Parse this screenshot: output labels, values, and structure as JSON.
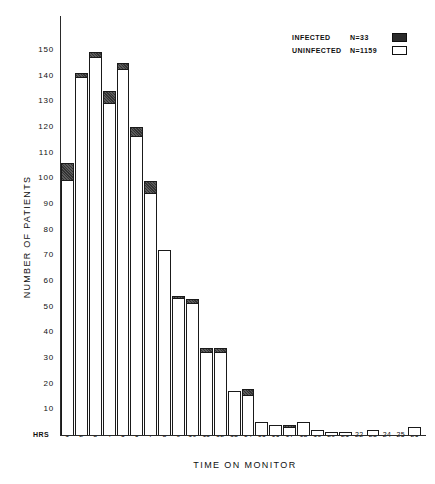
{
  "figure": {
    "y_axis_label": "NUMBER OF PATIENTS",
    "x_axis_label": "TIME ON MONITOR",
    "hrs_label": "HRS"
  },
  "legend": {
    "position": "top-right",
    "entries": [
      {
        "label": "INFECTED",
        "n": "N=33",
        "swatch": "filled-black-swatch"
      },
      {
        "label": "UNINFECTED",
        "n": "N=1159",
        "swatch": "open-white-swatch"
      }
    ]
  },
  "chart_data": {
    "type": "bar",
    "subtype": "stacked-histogram",
    "title": "",
    "xlabel": "TIME ON MONITOR",
    "ylabel": "NUMBER OF PATIENTS",
    "xlim": [
      0,
      26
    ],
    "ylim": [
      0,
      155
    ],
    "ytick_values": [
      10,
      20,
      30,
      40,
      50,
      60,
      70,
      80,
      90,
      100,
      110,
      120,
      130,
      140,
      150
    ],
    "ytick_labels": [
      "10",
      "20",
      "30",
      "40",
      "50",
      "60",
      "70",
      "80",
      "90",
      "100",
      "110",
      "120",
      "130",
      "140",
      "150"
    ],
    "grid": false,
    "categories": [
      1,
      2,
      3,
      4,
      5,
      6,
      7,
      8,
      9,
      10,
      11,
      12,
      13,
      14,
      15,
      16,
      17,
      18,
      19,
      20,
      21,
      22,
      23,
      24,
      25,
      26
    ],
    "xtick_labels": [
      "1",
      "2",
      "3",
      "4",
      "5",
      "6",
      "7",
      "8",
      "9",
      "10",
      "11",
      "12",
      "13",
      "14",
      "15",
      "16",
      "17",
      "18",
      "19",
      "20",
      "21",
      "22",
      "23",
      "24",
      "25",
      "26"
    ],
    "series": [
      {
        "name": "UNINFECTED",
        "color": "#ffffff",
        "total": 1159,
        "values": [
          99,
          139,
          147,
          129,
          142,
          116,
          94,
          72,
          53,
          51,
          32,
          32,
          17,
          15,
          5,
          4,
          3,
          5,
          2,
          1,
          1,
          0,
          2,
          0,
          0,
          3
        ]
      },
      {
        "name": "INFECTED",
        "color": "#333333",
        "total": 33,
        "values": [
          7,
          2,
          2,
          5,
          3,
          4,
          5,
          0,
          1,
          2,
          2,
          2,
          0,
          3,
          0,
          0,
          1,
          0,
          0,
          0,
          0,
          0,
          0,
          0,
          0,
          0
        ]
      }
    ],
    "totals": [
      106,
      141,
      149,
      134,
      145,
      120,
      99,
      72,
      54,
      53,
      34,
      34,
      17,
      18,
      5,
      4,
      4,
      5,
      2,
      1,
      1,
      0,
      2,
      0,
      0,
      3
    ]
  }
}
